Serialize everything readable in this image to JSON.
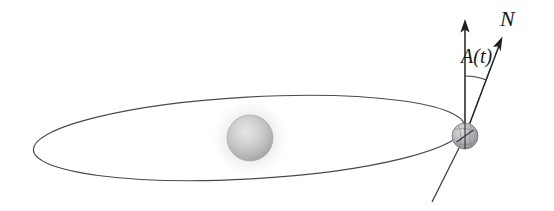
{
  "figure": {
    "background_color": "#ffffff",
    "width": 554,
    "height": 211
  },
  "labels": {
    "normal_axis": "N",
    "obliquity_angle": "A(t)"
  },
  "elements": {
    "orbit_name": "elliptical-orbit-path",
    "star_name": "central-star",
    "star_glow_name": "star-glow-halo",
    "planet_name": "orbiting-planet",
    "spin_axis_name": "planet-spin-axis",
    "orbital_normal_arrow_name": "orbital-normal-arrow",
    "spin_axis_arrow_name": "spin-axis-arrow",
    "angle_arc_name": "obliquity-angle-arc"
  },
  "geometry": {
    "orbit": {
      "center_x": 249,
      "center_y": 138,
      "semi_major": 216,
      "semi_minor": 41,
      "rotation_deg": -3.2
    },
    "star": {
      "center_x": 250,
      "center_y": 138,
      "core_radius": 23,
      "glow_radius": 39
    },
    "planet": {
      "center_x": 465,
      "center_y": 136,
      "radius": 13
    },
    "orbital_normal_arrow": {
      "x1": 465,
      "y1": 136,
      "x2": 465,
      "y2": 22
    },
    "spin_axis_arrow": {
      "x1": 465,
      "y1": 136,
      "x2": 502,
      "y2": 38
    },
    "spin_axis_tail": {
      "x1": 465,
      "y1": 136,
      "x2": 432,
      "y2": 202
    },
    "angle_arc": {
      "center_x": 465,
      "center_y": 136,
      "radius": 60,
      "start_deg": 90,
      "end_deg": 69
    }
  },
  "colors": {
    "stroke": "#3b3b3b",
    "label": "#1a1a1a",
    "star_core_light": "#e2e2e2",
    "star_core_dark": "#9d9d9d",
    "star_glow": "#eceaec",
    "planet_light": "#d6d6d6",
    "planet_dark": "#8f8f93",
    "background": "#ffffff"
  }
}
